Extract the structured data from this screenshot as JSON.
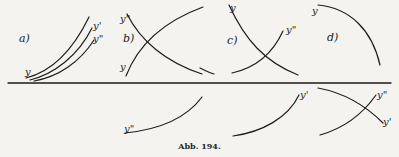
{
  "figure": {
    "caption": "Abb. 194.",
    "line_color": "#1c1c1c",
    "background": "#f4f3ef"
  },
  "panels": {
    "a": {
      "label": "a)",
      "curves": {
        "y": "y",
        "y1": "y'",
        "y2": "y\""
      }
    },
    "b": {
      "label": "b)",
      "curves": {
        "y2": "y\"",
        "y": "y"
      }
    },
    "c": {
      "label": "c)",
      "curves": {
        "y": "y",
        "y2": "y\""
      }
    },
    "d": {
      "label": "d)",
      "curves": {
        "y": "y"
      }
    }
  },
  "lower": {
    "left": {
      "label": "y\""
    },
    "middle": {
      "label": "y'"
    },
    "right": {
      "label_top": "y\"",
      "label_bottom": "y'"
    }
  }
}
